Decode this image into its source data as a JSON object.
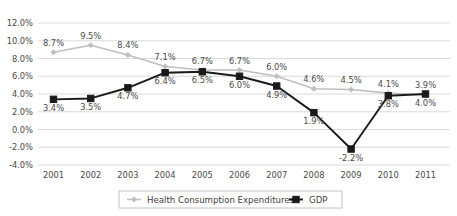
{
  "chart_data": {
    "type": "line",
    "title": "",
    "xlabel": "",
    "ylabel": "",
    "categories": [
      "2001",
      "2002",
      "2003",
      "2004",
      "2005",
      "2006",
      "2007",
      "2008",
      "2009",
      "2010",
      "2011"
    ],
    "ylim": [
      -4.0,
      12.0
    ],
    "ytick_labels": [
      "12.0%",
      "10.0%",
      "8.0%",
      "6.0%",
      "4.0%",
      "2.0%",
      "0.0%",
      "-2.0%",
      "-4.0%"
    ],
    "ytick_values": [
      12.0,
      10.0,
      8.0,
      6.0,
      4.0,
      2.0,
      0.0,
      -2.0,
      -4.0
    ],
    "grid": true,
    "legend_position": "bottom",
    "series": [
      {
        "name": "Health Consumption Expenditures",
        "color": "#bfbfbf",
        "marker": "diamond",
        "values": [
          8.7,
          9.5,
          8.4,
          7.1,
          6.7,
          6.7,
          6.0,
          4.6,
          4.5,
          4.1,
          3.9
        ],
        "labels": [
          "8.7%",
          "9.5%",
          "8.4%",
          "7.1%",
          "6.7%",
          "6.7%",
          "6.0%",
          "4.6%",
          "4.5%",
          "4.1%",
          "3.9%"
        ],
        "label_positions": [
          "above",
          "above",
          "above",
          "above",
          "above",
          "above",
          "above",
          "above",
          "above",
          "above",
          "above"
        ]
      },
      {
        "name": "GDP",
        "color": "#1a1a1a",
        "marker": "square",
        "values": [
          3.4,
          3.5,
          4.7,
          6.4,
          6.5,
          6.0,
          4.9,
          1.9,
          -2.2,
          3.8,
          4.0
        ],
        "labels": [
          "3.4%",
          "3.5%",
          "4.7%",
          "6.4%",
          "6.5%",
          "6.0%",
          "4.9%",
          "1.9%",
          "-2.2%",
          "3.8%",
          "4.0%"
        ],
        "label_positions": [
          "below",
          "below",
          "below",
          "below",
          "below",
          "below",
          "below",
          "below",
          "below",
          "below",
          "below"
        ]
      }
    ]
  },
  "legend": {
    "entries": [
      {
        "label": "Health Consumption Expenditures"
      },
      {
        "label": "GDP"
      }
    ]
  }
}
